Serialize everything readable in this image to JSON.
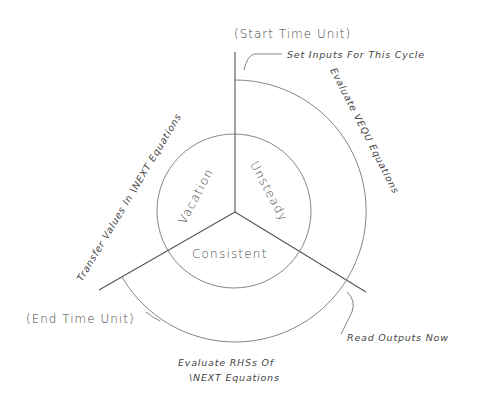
{
  "diagram": {
    "phases": {
      "unsteady": "Unsteady",
      "vacation": "Vacation",
      "consistent": "Consistent"
    },
    "markers": {
      "start": "(Start Time Unit)",
      "end": "(End Time Unit)"
    },
    "steps": {
      "set_inputs": "Set Inputs For This Cycle",
      "evaluate_vequ": "Evaluate VEQU Equations",
      "read_outputs": "Read Outputs Now",
      "evaluate_rhs_line1": "Evaluate RHSs Of",
      "evaluate_rhs_line2": "\\NEXT Equations",
      "transfer_values": "Transfer Values In \\NEXT Equations"
    },
    "colors": {
      "line": "#555555",
      "text": "#444444",
      "background": "#ffffff"
    }
  }
}
